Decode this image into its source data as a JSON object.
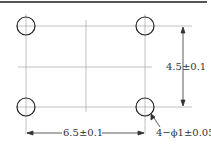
{
  "drawing": {
    "dim_vertical": "4.5±0.1",
    "dim_horizontal": "6.5±0.1",
    "hole_callout": "4−ϕ1±0.05",
    "colors": {
      "line": "#333333",
      "thin": "#888888",
      "border": "#555555"
    }
  }
}
